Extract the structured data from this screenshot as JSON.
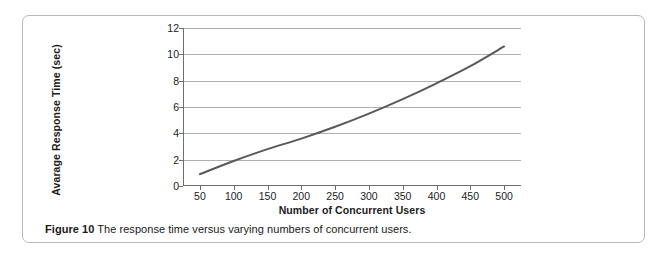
{
  "figure": {
    "caption_label": "Figure 10",
    "caption_text": "The response time versus varying numbers of concurrent users."
  },
  "chart_data": {
    "type": "line",
    "title": "",
    "xlabel": "Number of Concurrent Users",
    "ylabel": "Avarage Response Time (sec)",
    "x": [
      50,
      100,
      150,
      200,
      250,
      300,
      350,
      400,
      450,
      500
    ],
    "categories": [
      "50",
      "100",
      "150",
      "200",
      "250",
      "300",
      "350",
      "400",
      "450",
      "500"
    ],
    "series": [
      {
        "name": "Average response time",
        "values": [
          0.9,
          1.9,
          2.8,
          3.6,
          4.5,
          5.5,
          6.6,
          7.8,
          9.1,
          10.6
        ],
        "color": "#595959"
      }
    ],
    "xlim": [
      25,
      525
    ],
    "ylim": [
      0,
      12
    ],
    "yticks": [
      0,
      2,
      4,
      6,
      8,
      10,
      12
    ],
    "ytick_labels": [
      "0",
      "2",
      "4",
      "6",
      "8",
      "10",
      "12"
    ],
    "grid": "horizontal",
    "legend": "none",
    "line_color": "#595959",
    "grid_color": "#b0b0b0",
    "axis_color": "#6e6e6e"
  }
}
